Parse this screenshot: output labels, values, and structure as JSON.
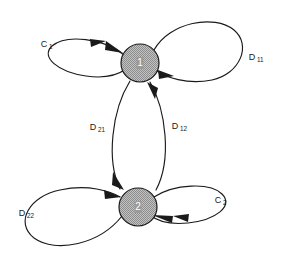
{
  "figure": {
    "type": "state-transition-diagram",
    "background_color": "#ffffff",
    "line_color": "#1a1a1a",
    "node_fill_color": "#b0b0b0",
    "node_label_color": "#ffffff"
  },
  "nodes": [
    {
      "id": "1",
      "label": "1",
      "cx": 140,
      "cy": 63,
      "r": 19,
      "fill": "#b0b0b0",
      "pattern": "checker-stipple"
    },
    {
      "id": "2",
      "label": "2",
      "cx": 138,
      "cy": 207,
      "r": 19,
      "fill": "#b0b0b0",
      "pattern": "checker-stipple"
    }
  ],
  "edges": [
    {
      "name": "self-loop-node1-left",
      "label_base": "C",
      "label_sub": "1",
      "label_x": 44,
      "label_y": 45,
      "from": "1",
      "to": "1",
      "direction": "left",
      "arrowheads": 2
    },
    {
      "name": "self-loop-node1-right",
      "label_base": "D",
      "label_sub": "11",
      "label_x": 252,
      "label_y": 58,
      "from": "1",
      "to": "1",
      "direction": "right",
      "arrowheads": 1
    },
    {
      "name": "arc-node1-to-node2",
      "label_base": "D",
      "label_sub": "21",
      "label_x": 93,
      "label_y": 128,
      "from": "1",
      "to": "2",
      "direction": "down",
      "arrowheads": 1
    },
    {
      "name": "arc-node2-to-node1",
      "label_base": "D",
      "label_sub": "12",
      "label_x": 175,
      "label_y": 127,
      "from": "2",
      "to": "1",
      "direction": "up",
      "arrowheads": 1
    },
    {
      "name": "self-loop-node2-left",
      "label_base": "D",
      "label_sub": "22",
      "label_x": 22,
      "label_y": 214,
      "from": "2",
      "to": "2",
      "direction": "left",
      "arrowheads": 1
    },
    {
      "name": "self-loop-node2-right",
      "label_base": "C",
      "label_sub": "2",
      "label_x": 218,
      "label_y": 201,
      "from": "2",
      "to": "2",
      "direction": "right",
      "arrowheads": 2
    }
  ]
}
